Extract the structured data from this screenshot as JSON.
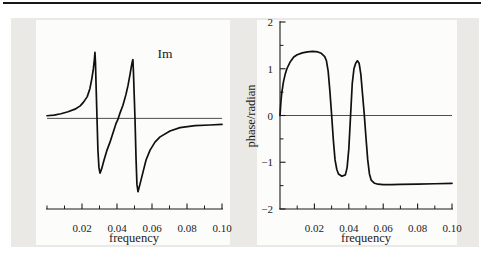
{
  "page": {
    "background": "#ffffff",
    "panel_background": "#eae9e5",
    "plot_background": "#fcfcfb",
    "rule_color": "#161616",
    "axis_color": "#1a1a1a",
    "curve_color": "#101010",
    "zero_line_color": "#3a3a3a",
    "text_color": "#1b1b1b"
  },
  "chart_data": [
    {
      "type": "line",
      "title": "Im",
      "xlabel": "frequency",
      "ylabel": "",
      "xlim": [
        0,
        0.1
      ],
      "ylim": [
        -1.37,
        1.52
      ],
      "grid": false,
      "legend": "none",
      "zero_line": true,
      "x_ticks_major": [
        0.02,
        0.04,
        0.06,
        0.08,
        0.1
      ],
      "x_tick_labels": [
        "0.02",
        "0.04",
        "0.06",
        "0.08",
        "0.10"
      ],
      "x_ticks_minor": [
        0.0,
        0.01,
        0.03,
        0.05,
        0.07,
        0.09
      ],
      "series": [
        {
          "x": [
            0,
            0.004,
            0.008,
            0.012,
            0.016,
            0.019,
            0.021,
            0.023,
            0.0245,
            0.0256,
            0.0265,
            0.0271,
            0.0274,
            0.0277,
            0.0281,
            0.0286,
            0.0291,
            0.0297,
            0.0303,
            0.0314,
            0.0326,
            0.0343,
            0.036,
            0.0377,
            0.0394,
            0.0406,
            0.0417,
            0.0434,
            0.0451,
            0.0463,
            0.0474,
            0.0483,
            0.0489,
            0.0491,
            0.0494,
            0.0499,
            0.0503,
            0.0509,
            0.0514,
            0.052,
            0.0531,
            0.0549,
            0.0566,
            0.0589,
            0.0617,
            0.0646,
            0.0703,
            0.076,
            0.0846,
            0.0931,
            0.1
          ],
          "y": [
            0.04,
            0.05,
            0.07,
            0.1,
            0.14,
            0.19,
            0.25,
            0.33,
            0.45,
            0.6,
            0.75,
            0.9,
            1.0,
            0.85,
            0.45,
            -0.02,
            -0.48,
            -0.75,
            -0.83,
            -0.75,
            -0.63,
            -0.48,
            -0.36,
            -0.22,
            -0.08,
            -0.01,
            0.08,
            0.2,
            0.36,
            0.5,
            0.66,
            0.8,
            0.88,
            0.89,
            0.7,
            0.3,
            -0.02,
            -0.63,
            -1.0,
            -1.11,
            -1.0,
            -0.81,
            -0.63,
            -0.48,
            -0.36,
            -0.28,
            -0.19,
            -0.14,
            -0.11,
            -0.1,
            -0.09
          ]
        }
      ]
    },
    {
      "type": "line",
      "title": "",
      "xlabel": "frequency",
      "ylabel": "phase/radian",
      "xlim": [
        0,
        0.1
      ],
      "ylim": [
        -2,
        2
      ],
      "grid": false,
      "legend": "none",
      "zero_line": true,
      "x_ticks_major": [
        0.02,
        0.04,
        0.06,
        0.08,
        0.1
      ],
      "x_tick_labels": [
        "0.02",
        "0.04",
        "0.06",
        "0.08",
        "0.10"
      ],
      "x_ticks_minor": [
        0.01,
        0.03,
        0.05,
        0.07,
        0.09
      ],
      "y_ticks_major": [
        -2,
        -1,
        0,
        1,
        2
      ],
      "y_tick_labels": [
        "−2",
        "−1",
        "0",
        "1",
        "2"
      ],
      "y_ticks_minor": [
        -1.5,
        -0.5,
        0.5,
        1.5
      ],
      "series": [
        {
          "x": [
            0,
            0.0005,
            0.001,
            0.002,
            0.003,
            0.004,
            0.006,
            0.008,
            0.01,
            0.013,
            0.016,
            0.019,
            0.022,
            0.024,
            0.026,
            0.027,
            0.028,
            0.029,
            0.03,
            0.031,
            0.032,
            0.033,
            0.034,
            0.036,
            0.038,
            0.039,
            0.04,
            0.041,
            0.042,
            0.043,
            0.044,
            0.045,
            0.046,
            0.047,
            0.048,
            0.049,
            0.05,
            0.051,
            0.052,
            0.053,
            0.055,
            0.057,
            0.06,
            0.065,
            0.07,
            0.08,
            0.09,
            0.1
          ],
          "y": [
            0,
            0.28,
            0.48,
            0.72,
            0.88,
            1.0,
            1.15,
            1.25,
            1.3,
            1.34,
            1.36,
            1.37,
            1.36,
            1.33,
            1.26,
            1.17,
            0.95,
            0.52,
            0.02,
            -0.52,
            -0.95,
            -1.15,
            -1.25,
            -1.3,
            -1.27,
            -1.12,
            -0.72,
            -0.02,
            0.68,
            1.0,
            1.12,
            1.17,
            1.12,
            0.88,
            0.45,
            0.02,
            -0.48,
            -0.95,
            -1.25,
            -1.38,
            -1.45,
            -1.47,
            -1.48,
            -1.48,
            -1.475,
            -1.47,
            -1.46,
            -1.45
          ]
        }
      ]
    }
  ]
}
